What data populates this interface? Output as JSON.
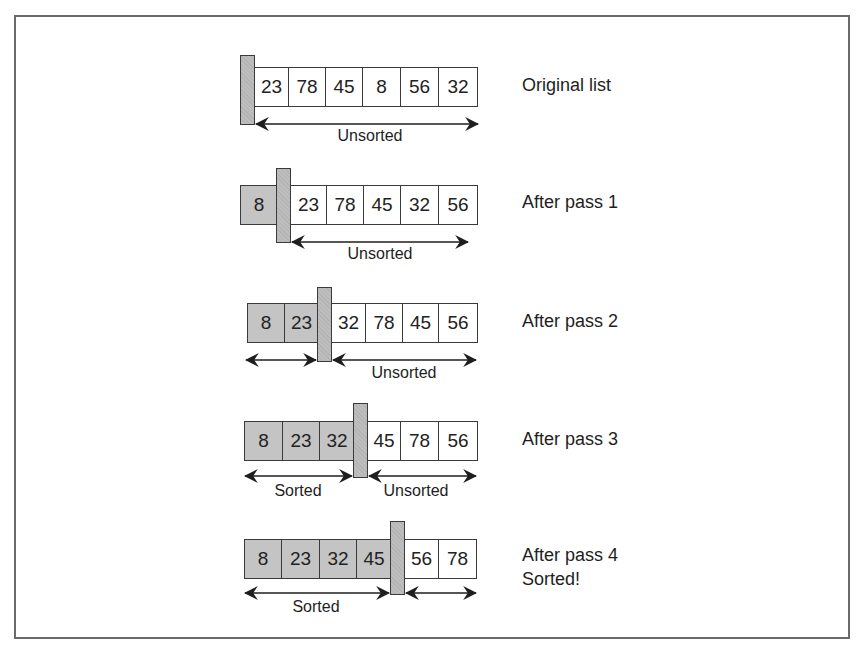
{
  "diagram": {
    "colors": {
      "sorted_fill": "#c4c4c4",
      "unsorted_fill": "#ffffff",
      "divider_fill": "#bdbdbd",
      "border": "#3a3a3a"
    },
    "rows": [
      {
        "label": "Original list",
        "values": [
          "23",
          "78",
          "45",
          "8",
          "56",
          "32"
        ],
        "sorted_count": 0,
        "arrow_labels": {
          "sorted": "",
          "unsorted": "Unsorted"
        }
      },
      {
        "label": "After pass 1",
        "values": [
          "8",
          "23",
          "78",
          "45",
          "32",
          "56"
        ],
        "sorted_count": 1,
        "arrow_labels": {
          "sorted": "",
          "unsorted": "Unsorted"
        }
      },
      {
        "label": "After pass 2",
        "values": [
          "8",
          "23",
          "32",
          "78",
          "45",
          "56"
        ],
        "sorted_count": 2,
        "arrow_labels": {
          "sorted": "",
          "unsorted": "Unsorted"
        }
      },
      {
        "label": "After pass 3",
        "values": [
          "8",
          "23",
          "32",
          "45",
          "78",
          "56"
        ],
        "sorted_count": 3,
        "arrow_labels": {
          "sorted": "Sorted",
          "unsorted": "Unsorted"
        }
      },
      {
        "label": "After pass 4\nSorted!",
        "values": [
          "8",
          "23",
          "32",
          "45",
          "56",
          "78"
        ],
        "sorted_count": 4,
        "arrow_labels": {
          "sorted": "Sorted",
          "unsorted": ""
        }
      }
    ]
  }
}
